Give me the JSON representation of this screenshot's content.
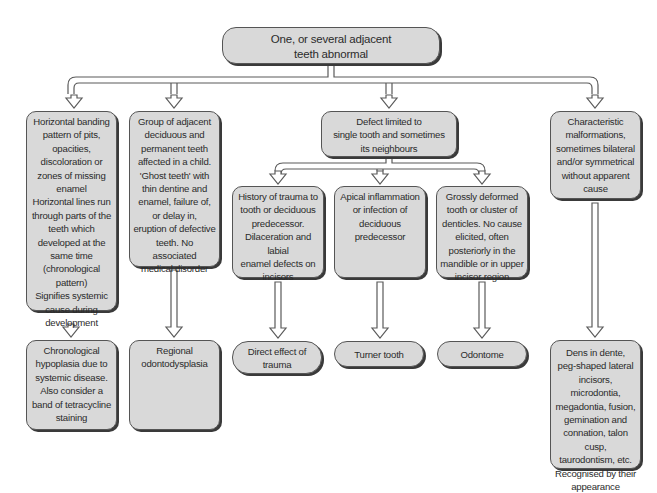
{
  "diagram": {
    "root": {
      "id": "root",
      "text": "One, or several adjacent\nteeth abnormal"
    },
    "level1": [
      {
        "id": "chrono-pattern",
        "text": "Horizontal banding\npattern of pits,\nopacities,\ndiscoloration or\nzones of missing\nenamel\nHorizontal lines run\nthrough parts of the\nteeth which\ndeveloped at the\nsame time\n(chronological\npattern)\nSignifies systemic\ncause during\ndevelopment"
      },
      {
        "id": "ghost-teeth",
        "text": "Group of adjacent\ndeciduous and\npermanent teeth\naffected in a child.\n'Ghost teeth' with\nthin dentine and\nenamel, failure of,\nor delay in,\neruption of defective\nteeth. No associated\nmedical disorder"
      },
      {
        "id": "single-tooth",
        "text": "Defect limited to\nsingle tooth and sometimes\nits neighbours"
      },
      {
        "id": "characteristic",
        "text": "Characteristic\nmalformations,\nsometimes bilateral\nand/or symmetrical\nwithout apparent\ncause"
      }
    ],
    "level2": [
      {
        "id": "trauma-history",
        "text": "History of trauma to\ntooth or deciduous\npredecessor.\nDilaceration and labial\nenamel defects on\nincisors"
      },
      {
        "id": "apical-inflammation",
        "text": "Apical inflammation\nor infection of\ndeciduous\npredecessor"
      },
      {
        "id": "deformed-tooth",
        "text": "Grossly deformed\ntooth or cluster of\ndenticles. No cause\nelicited, often\nposteriorly in the\nmandible or in upper\nincisor region"
      }
    ],
    "outcomes": [
      {
        "id": "chronological-hypoplasia",
        "text": "Chronological\nhypoplasia due to\nsystemic disease.\nAlso consider a\nband of tetracycline\nstaining"
      },
      {
        "id": "regional-odontodysplasia",
        "text": "Regional\nodontodysplasia"
      },
      {
        "id": "direct-trauma",
        "text": "Direct effect of\ntrauma"
      },
      {
        "id": "turner-tooth",
        "text": "Turner tooth"
      },
      {
        "id": "odontome",
        "text": "Odontome"
      },
      {
        "id": "dens-in-dente",
        "text": "Dens in dente,\npeg-shaped lateral\nincisors, microdontia,\nmegadontia, fusion,\ngemination and\nconnation, talon cusp,\ntaurodontism, etc.\nRecognised by their\nappearance"
      }
    ],
    "colors": {
      "box_fill": "#d9d9d9",
      "box_border": "#555555",
      "arrow_stroke": "#5a5a5a",
      "arrow_fill": "#ffffff",
      "text": "#2b2b2b"
    }
  }
}
